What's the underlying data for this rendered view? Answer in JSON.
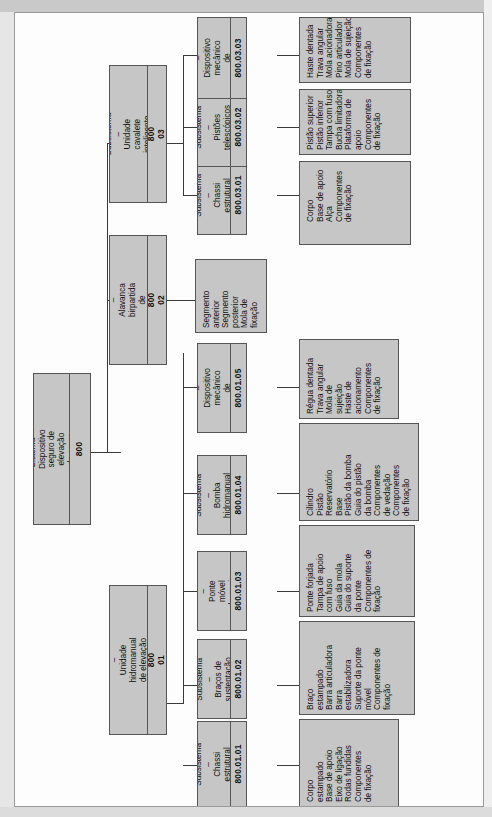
{
  "diagram": {
    "orientation": "rotated-90-ccw",
    "colors": {
      "node_fill": "#c6c6c6",
      "node_border": "#555555",
      "sheet": "#fdfdfd",
      "connector": "#3a3a3a"
    }
  },
  "root": {
    "title": "Sistema – Dispositivo seguro de\nelevação de carga",
    "code": "800"
  },
  "level2": [
    {
      "title": "Subsistema –\nUnidade hidromanual\nde elevação de carga",
      "code": "800 01"
    },
    {
      "title": "Subsistema –\nAlavanca birpartida\nde acionamento",
      "code": "800 02"
    },
    {
      "title": "Subsistema –\nUnidade cavalete\ninteligente",
      "code": "800 03"
    }
  ],
  "level3": [
    {
      "title": "Subsistema –\nChassi\nestrutural",
      "code": "800.01.01"
    },
    {
      "title": "Subsistema –\nBraços de\nsustentação",
      "code": "800.01.02"
    },
    {
      "title": "Subsistema –\nPonte móvel\nde apoio",
      "code": "800.01.03"
    },
    {
      "title": "Subsistema –\nBomba\nhidromanual",
      "code": "800.01.04"
    },
    {
      "title": "Subsistema –\nDispositivo\nmecânico de\ntravamento",
      "code": "800.01.05"
    },
    {
      "title": "Subsistema –\nChassi\nestrutural",
      "code": "800.03.01"
    },
    {
      "title": "Subsistema –\nPistões\ntelescópicos",
      "code": "800.03.02"
    },
    {
      "title": "Subsistema –\nDispositivo\nmecânico de\ntravamento",
      "code": "800.03.03"
    }
  ],
  "leaves": {
    "c800_01_01": "Corpo\nestampado\nBase de apoio\nEixo de ligação\nRodas fundidas\nComponentes\nde fixação",
    "c800_01_02": "Braço\nestampado\nBarra articuladora\nBarra\nestabilizadora\nSuporte da ponte\nmóvel\nComponentes de\nfixação",
    "c800_01_03": "Ponte forjada\nTampa de apoio\ncom fuso\nGuia da mola\nGuia do suporte\nda ponte\nComponentes de\nfixação",
    "c800_01_04": "Cilindro\nPistão\nReservatório\nBase\nPistão da bomba\nGuia do pistão\nda bomba\nComponentes\nde vedação\nComponentes\nde fixação",
    "c800_01_05": "Régua dentada\nTrava angular\nMola de\nsujeição\nHaste de\nacionamento\nComponentes\nde fixação",
    "c800_02": "Segmento\nanterior\nSegmento\nposterior\nMola de\nfixação",
    "c800_03_01": "Corpo\nBase de apoio\nAlça\nComponentes\nde fixação",
    "c800_03_02": "Pistão superior\nPistão inferior\nTampa com fuso\nBucha limitadora\nPlataforma de\napoio\nComponentes\nde fixação",
    "c800_03_03": "Haste dentada\nTrava angular\nMola acionadora\nPino articulador\nMola de sujeição\nComponentes\nde fixação"
  }
}
